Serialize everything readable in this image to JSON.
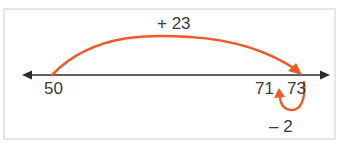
{
  "diagram": {
    "type": "number-line",
    "colors": {
      "line": "#2b2b2b",
      "jump": "#f05a28",
      "frame": "#e6e7e2",
      "text": "#3a3a3a"
    },
    "labels": {
      "start": "50",
      "tick_71": "71",
      "tick_73": "73",
      "jump_forward": "+ 23",
      "jump_back": "– 2"
    },
    "jumps": [
      {
        "from": 50,
        "to": 73,
        "label": "+ 23",
        "direction": "forward"
      },
      {
        "from": 73,
        "to": 71,
        "label": "– 2",
        "direction": "backward"
      }
    ]
  }
}
